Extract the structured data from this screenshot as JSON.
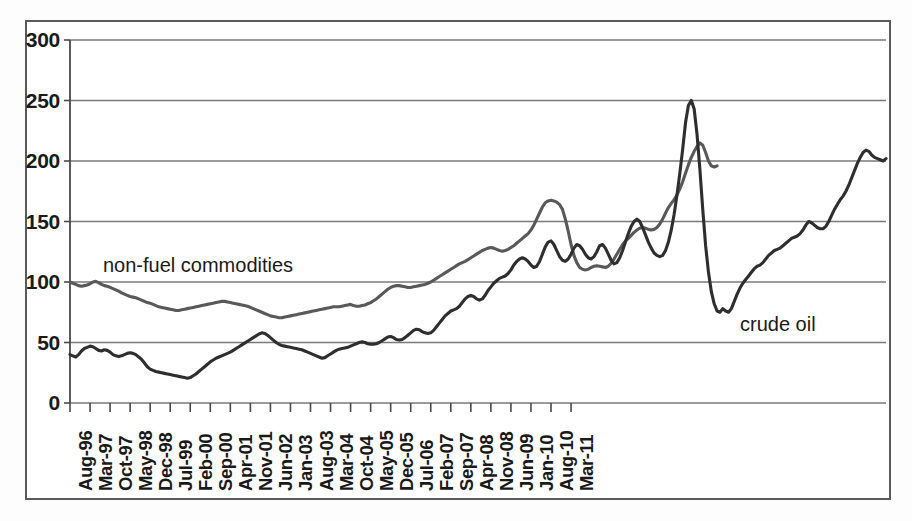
{
  "chart_data": {
    "type": "line",
    "title": "",
    "subtitle": "",
    "xlabel": "",
    "ylabel": "",
    "ylim": [
      0,
      300
    ],
    "yticks": [
      0,
      50,
      100,
      150,
      200,
      250,
      300
    ],
    "ytick_labels": [
      "0",
      "50",
      "100",
      "150",
      "200",
      "250",
      "300"
    ],
    "grid": "horizontal",
    "legend_position": "inline-annotations",
    "x_tick_labels": [
      "Aug-96",
      "Mar-97",
      "Oct-97",
      "May-98",
      "Dec-98",
      "Jul-99",
      "Feb-00",
      "Sep-00",
      "Apr-01",
      "Nov-01",
      "Jun-02",
      "Jan-03",
      "Aug-03",
      "Mar-04",
      "Oct-04",
      "May-05",
      "Dec-05",
      "Jul-06",
      "Feb-07",
      "Sep-07",
      "Apr-08",
      "Nov-08",
      "Jun-09",
      "Jan-10",
      "Aug-10",
      "Mar-11"
    ],
    "x_tick_step_months": 7,
    "x_start": "Aug-96",
    "x_end": "Aug-11",
    "annotations": [
      {
        "text": "non-fuel commodities",
        "series": "non-fuel commodities"
      },
      {
        "text": "crude oil",
        "series": "crude oil"
      }
    ],
    "series": [
      {
        "name": "non-fuel commodities",
        "color": "#595959",
        "values": [
          100,
          99,
          98,
          97,
          96.5,
          97,
          97.5,
          98.5,
          100,
          100.5,
          99.5,
          98,
          97,
          96.5,
          95.5,
          94.5,
          93.5,
          92.5,
          91,
          90,
          89,
          88,
          87.5,
          87,
          86,
          85,
          84,
          83,
          82.5,
          81.5,
          80.5,
          79.5,
          79,
          78.5,
          78,
          77.5,
          77,
          76.5,
          76.5,
          77,
          77.5,
          78,
          78.5,
          79,
          79.5,
          80,
          80.5,
          81,
          81.5,
          82,
          82.5,
          83,
          83.5,
          84,
          84,
          83.5,
          83,
          82.5,
          82,
          81.5,
          81,
          80.5,
          80,
          79,
          78,
          77,
          76,
          75,
          74,
          73,
          72,
          71.5,
          71,
          70.5,
          70.5,
          71,
          71.5,
          72,
          72.5,
          73,
          73.5,
          74,
          74.5,
          75,
          75.5,
          76,
          76.5,
          77,
          77.5,
          78,
          78.5,
          79,
          79.5,
          79.5,
          79.5,
          80,
          80.5,
          81,
          81.5,
          80.5,
          80,
          80,
          80.5,
          81,
          82,
          83,
          84.5,
          86,
          88,
          90,
          92,
          94,
          95.5,
          96.5,
          97,
          97,
          96.5,
          96,
          95.5,
          95.5,
          96,
          96.5,
          97,
          97.5,
          98,
          99,
          100,
          101.5,
          103,
          104.5,
          106,
          107.5,
          109,
          110.5,
          112,
          113.5,
          115,
          116,
          117,
          118.5,
          120,
          121.5,
          123,
          124.5,
          126,
          127,
          128,
          128.5,
          128,
          127,
          126,
          125.5,
          126,
          127,
          128.5,
          130,
          132,
          134,
          136,
          138,
          140,
          143,
          147,
          152,
          157,
          162,
          165.5,
          167,
          167.5,
          167,
          166,
          164,
          160,
          152,
          142,
          131,
          122,
          116,
          112,
          110.5,
          110,
          110.5,
          112,
          113,
          113.5,
          113,
          112.5,
          112,
          113,
          115.5,
          119,
          123,
          127,
          131,
          134,
          136,
          138.5,
          141,
          143,
          144.5,
          145,
          144.5,
          143.5,
          143,
          143.5,
          145,
          148,
          152,
          157,
          161.5,
          165,
          168,
          172,
          177,
          183,
          190,
          197,
          203,
          208,
          212,
          215,
          213,
          207,
          200,
          196,
          195,
          196
        ]
      },
      {
        "name": "crude oil",
        "color": "#2e2e2e",
        "values": [
          40,
          39,
          38,
          40,
          43,
          45,
          46,
          47,
          46.5,
          45,
          43.5,
          43,
          44,
          43.5,
          42,
          40,
          39,
          38.5,
          39,
          40,
          41,
          41.5,
          41,
          40,
          38,
          36,
          33,
          30,
          28,
          27,
          26,
          25.5,
          25,
          24.5,
          24,
          23.5,
          23,
          22.5,
          22,
          21.5,
          21,
          20.5,
          21,
          22.5,
          24,
          26,
          28,
          30,
          32,
          34,
          35.5,
          37,
          38,
          39,
          40,
          41,
          42,
          43.5,
          45,
          46.5,
          48,
          49.5,
          51,
          52.5,
          54,
          55.5,
          57,
          58,
          57.5,
          56,
          54,
          52,
          50,
          48.5,
          47.5,
          47,
          46.5,
          46,
          45.5,
          45,
          44.5,
          44,
          43,
          42,
          41,
          40,
          39,
          38,
          37,
          37.5,
          39,
          40.5,
          42,
          43.5,
          44.5,
          45,
          45.5,
          46,
          47,
          48,
          49,
          50,
          50.5,
          50,
          49,
          48.5,
          48.5,
          49,
          50,
          51.5,
          53,
          54.5,
          55,
          54,
          52.5,
          52,
          52.5,
          54,
          56,
          58,
          60,
          61,
          60.5,
          59,
          58,
          57.5,
          58,
          60,
          63,
          66,
          69,
          72,
          74,
          76,
          77,
          78,
          80,
          83,
          86,
          88,
          89,
          88,
          86,
          85,
          86,
          89,
          93,
          96,
          99,
          101,
          103,
          104,
          105,
          107,
          110,
          114,
          117,
          119,
          120,
          119,
          117,
          114,
          112,
          113,
          117,
          123,
          129,
          133,
          134,
          131,
          126,
          121,
          118,
          117,
          119,
          123,
          128,
          131,
          130,
          127,
          123,
          120,
          119,
          121,
          125,
          130,
          131,
          128,
          123,
          118,
          115,
          116,
          120,
          126,
          133,
          140,
          146,
          150,
          152,
          150,
          145,
          139,
          133,
          128,
          124,
          122,
          121,
          122,
          126,
          133,
          143,
          156,
          172,
          190,
          210,
          232,
          246,
          250,
          243,
          222,
          193,
          160,
          130,
          108,
          92,
          82,
          76,
          75,
          78,
          76,
          75,
          78,
          84,
          90,
          95,
          99,
          102,
          105,
          108,
          111,
          113,
          114,
          116,
          119,
          122,
          124,
          126,
          127,
          128,
          130,
          132,
          134,
          136,
          137,
          138,
          140,
          143,
          147,
          150,
          149,
          147,
          145,
          144,
          144,
          146,
          150,
          155,
          160,
          164,
          168,
          171,
          175,
          180,
          186,
          192,
          198,
          203,
          207,
          209,
          208,
          205,
          203,
          202,
          201,
          200,
          202
        ]
      }
    ]
  },
  "axis": {
    "y_labels": [
      "300",
      "250",
      "200",
      "150",
      "100",
      "50",
      "0"
    ],
    "x_labels": [
      "Aug-96",
      "Mar-97",
      "Oct-97",
      "May-98",
      "Dec-98",
      "Jul-99",
      "Feb-00",
      "Sep-00",
      "Apr-01",
      "Nov-01",
      "Jun-02",
      "Jan-03",
      "Aug-03",
      "Mar-04",
      "Oct-04",
      "May-05",
      "Dec-05",
      "Jul-06",
      "Feb-07",
      "Sep-07",
      "Apr-08",
      "Nov-08",
      "Jun-09",
      "Jan-10",
      "Aug-10",
      "Mar-11"
    ]
  },
  "labels": {
    "nonfuel": "non-fuel commodities",
    "crude": "crude oil"
  },
  "colors": {
    "nonfuel_line": "#595959",
    "crude_line": "#2e2e2e",
    "gridline": "#7a7a7a",
    "axis": "#4a4a4a",
    "frame": "#5a5a5a",
    "background": "#ffffff"
  }
}
